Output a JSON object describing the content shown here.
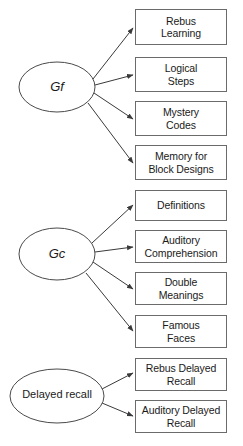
{
  "diagram": {
    "type": "path-diagram",
    "title_visible": false,
    "background_color": "#ffffff",
    "box_border_color": "#6b6b6b",
    "ellipse_border_color": "#4a4a4a",
    "arrow_color": "#3a3a3a",
    "text_color": "#1a1a1a",
    "latent_factors": [
      {
        "id": "gf",
        "label": "Gf",
        "style": "italic",
        "cx": 57,
        "cy": 87,
        "rx": 38,
        "ry": 25,
        "indicator_ids": [
          "rebus-learning",
          "logical-steps",
          "mystery-codes",
          "memory-for-block-designs"
        ]
      },
      {
        "id": "gc",
        "label": "Gc",
        "style": "italic",
        "cx": 57,
        "cy": 254,
        "rx": 38,
        "ry": 26,
        "indicator_ids": [
          "definitions",
          "auditory-comprehension",
          "double-meanings",
          "famous-faces"
        ]
      },
      {
        "id": "delayed-recall",
        "label": "Delayed recall",
        "style": "plain",
        "cx": 57,
        "cy": 396,
        "rx": 47,
        "ry": 27,
        "indicator_ids": [
          "rebus-delayed-recall",
          "auditory-delayed-recall"
        ]
      }
    ],
    "indicators": [
      {
        "id": "rebus-learning",
        "label": "Rebus\nLearning",
        "x": 135,
        "y": 9,
        "w": 92,
        "h": 36
      },
      {
        "id": "logical-steps",
        "label": "Logical\nSteps",
        "x": 135,
        "y": 57,
        "w": 92,
        "h": 35
      },
      {
        "id": "mystery-codes",
        "label": "Mystery\nCodes",
        "x": 135,
        "y": 101,
        "w": 92,
        "h": 35
      },
      {
        "id": "memory-for-block-designs",
        "label": "Memory for\nBlock Designs",
        "x": 135,
        "y": 145,
        "w": 92,
        "h": 35
      },
      {
        "id": "definitions",
        "label": "Definitions",
        "x": 135,
        "y": 190,
        "w": 92,
        "h": 31
      },
      {
        "id": "auditory-comprehension",
        "label": "Auditory\nComprehension",
        "x": 135,
        "y": 230,
        "w": 92,
        "h": 33
      },
      {
        "id": "double-meanings",
        "label": "Double\nMeanings",
        "x": 135,
        "y": 272,
        "w": 92,
        "h": 33
      },
      {
        "id": "famous-faces",
        "label": "Famous\nFaces",
        "x": 135,
        "y": 315,
        "w": 92,
        "h": 33
      },
      {
        "id": "rebus-delayed-recall",
        "label": "Rebus Delayed\nRecall",
        "x": 135,
        "y": 358,
        "w": 92,
        "h": 33
      },
      {
        "id": "auditory-delayed-recall",
        "label": "Auditory Delayed\nRecall",
        "x": 135,
        "y": 400,
        "w": 92,
        "h": 33
      }
    ],
    "arrows": [
      {
        "id": "gf-to-rebus-learning",
        "from": "gf",
        "to": "rebus-learning",
        "x1": 93,
        "y1": 79,
        "x2": 133,
        "y2": 28
      },
      {
        "id": "gf-to-logical-steps",
        "from": "gf",
        "to": "logical-steps",
        "x1": 95,
        "y1": 85,
        "x2": 133,
        "y2": 75
      },
      {
        "id": "gf-to-mystery-codes",
        "from": "gf",
        "to": "mystery-codes",
        "x1": 94,
        "y1": 93,
        "x2": 133,
        "y2": 119
      },
      {
        "id": "gf-to-memory-for-block-designs",
        "from": "gf",
        "to": "memory-for-block-designs",
        "x1": 88,
        "y1": 103,
        "x2": 133,
        "y2": 163
      },
      {
        "id": "gc-to-definitions",
        "from": "gc",
        "to": "definitions",
        "x1": 92,
        "y1": 243,
        "x2": 133,
        "y2": 205
      },
      {
        "id": "gc-to-auditory-comprehension",
        "from": "gc",
        "to": "auditory-comprehension",
        "x1": 95,
        "y1": 252,
        "x2": 133,
        "y2": 247
      },
      {
        "id": "gc-to-double-meanings",
        "from": "gc",
        "to": "double-meanings",
        "x1": 93,
        "y1": 262,
        "x2": 133,
        "y2": 289
      },
      {
        "id": "gc-to-famous-faces",
        "from": "gc",
        "to": "famous-faces",
        "x1": 86,
        "y1": 273,
        "x2": 133,
        "y2": 331
      },
      {
        "id": "delayed-to-rebus-delayed-recall",
        "from": "delayed-recall",
        "to": "rebus-delayed-recall",
        "x1": 102,
        "y1": 389,
        "x2": 133,
        "y2": 373
      },
      {
        "id": "delayed-to-auditory-delayed",
        "from": "delayed-recall",
        "to": "auditory-delayed-recall",
        "x1": 102,
        "y1": 403,
        "x2": 133,
        "y2": 416
      }
    ]
  }
}
